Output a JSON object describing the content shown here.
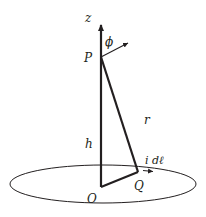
{
  "diagram": {
    "colors": {
      "stroke": "#231f20",
      "background": "#ffffff"
    },
    "labels": {
      "z_axis": "z",
      "point_P": "P",
      "angle": "ϕ",
      "distance_r": "r",
      "height_h": "h",
      "current_element": "i dℓ",
      "origin": "O",
      "point_Q": "Q"
    }
  }
}
